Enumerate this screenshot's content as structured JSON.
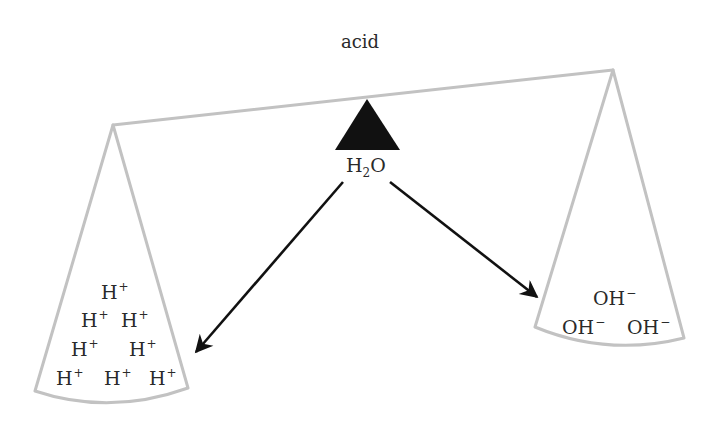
{
  "title": "acid",
  "fulcrum": {
    "label_main": "H",
    "label_sub": "2",
    "label_end": "O"
  },
  "colors": {
    "beam": "#c2c2c2",
    "fulcrum": "#111111",
    "arrow": "#111111",
    "text": "#2a2a2a"
  },
  "left_pan": {
    "ion": "H",
    "charge": "+",
    "count": 8,
    "rows": [
      1,
      2,
      2,
      3
    ]
  },
  "right_pan": {
    "ion": "OH",
    "charge": "−",
    "count": 3,
    "rows": [
      1,
      2
    ]
  },
  "arrows": [
    {
      "from": "H2O",
      "to": "left_pan"
    },
    {
      "from": "H2O",
      "to": "right_pan"
    }
  ]
}
